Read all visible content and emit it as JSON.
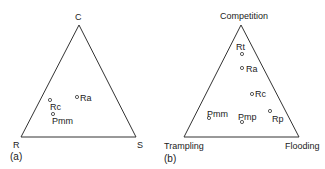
{
  "panels": [
    {
      "caption": "(a)",
      "vertices": {
        "top": "C",
        "left": "R",
        "right": "S"
      },
      "points": [
        {
          "label": "Ra"
        },
        {
          "label": "Rc"
        },
        {
          "label": "Pmm"
        }
      ]
    },
    {
      "caption": "(b)",
      "vertices": {
        "top": "Competition",
        "left": "Trampling",
        "right": "Flooding"
      },
      "points": [
        {
          "label": "Rt"
        },
        {
          "label": "Ra"
        },
        {
          "label": "Rc"
        },
        {
          "label": "Pmm"
        },
        {
          "label": "Pmp"
        },
        {
          "label": "Rp"
        }
      ]
    }
  ]
}
